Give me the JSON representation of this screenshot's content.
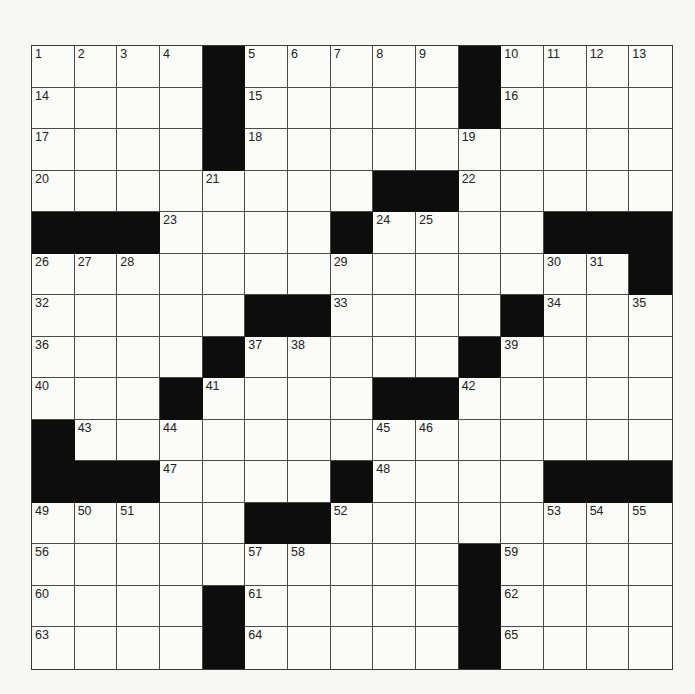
{
  "puzzle": {
    "rows": 15,
    "cols": 15,
    "colors": {
      "black_square": "#0d0d0d",
      "white_square": "#fbfbf9",
      "grid_line": "#4a4a4a",
      "number_text": "#222222"
    },
    "black_squares": [
      [
        0,
        4
      ],
      [
        0,
        10
      ],
      [
        1,
        4
      ],
      [
        1,
        10
      ],
      [
        2,
        4
      ],
      [
        3,
        8
      ],
      [
        3,
        9
      ],
      [
        4,
        0
      ],
      [
        4,
        1
      ],
      [
        4,
        2
      ],
      [
        4,
        7
      ],
      [
        4,
        12
      ],
      [
        4,
        13
      ],
      [
        4,
        14
      ],
      [
        5,
        14
      ],
      [
        6,
        5
      ],
      [
        6,
        6
      ],
      [
        6,
        11
      ],
      [
        7,
        4
      ],
      [
        7,
        10
      ],
      [
        8,
        3
      ],
      [
        8,
        8
      ],
      [
        8,
        9
      ],
      [
        9,
        0
      ],
      [
        10,
        0
      ],
      [
        10,
        1
      ],
      [
        10,
        2
      ],
      [
        10,
        7
      ],
      [
        10,
        12
      ],
      [
        10,
        13
      ],
      [
        10,
        14
      ],
      [
        11,
        5
      ],
      [
        11,
        6
      ],
      [
        12,
        10
      ],
      [
        13,
        4
      ],
      [
        13,
        10
      ],
      [
        14,
        4
      ],
      [
        14,
        10
      ]
    ],
    "numbered_cells": [
      {
        "r": 0,
        "c": 0,
        "n": "1"
      },
      {
        "r": 0,
        "c": 1,
        "n": "2"
      },
      {
        "r": 0,
        "c": 2,
        "n": "3"
      },
      {
        "r": 0,
        "c": 3,
        "n": "4"
      },
      {
        "r": 0,
        "c": 5,
        "n": "5"
      },
      {
        "r": 0,
        "c": 6,
        "n": "6"
      },
      {
        "r": 0,
        "c": 7,
        "n": "7"
      },
      {
        "r": 0,
        "c": 8,
        "n": "8"
      },
      {
        "r": 0,
        "c": 9,
        "n": "9"
      },
      {
        "r": 0,
        "c": 11,
        "n": "10"
      },
      {
        "r": 0,
        "c": 12,
        "n": "11"
      },
      {
        "r": 0,
        "c": 13,
        "n": "12"
      },
      {
        "r": 0,
        "c": 14,
        "n": "13"
      },
      {
        "r": 1,
        "c": 0,
        "n": "14"
      },
      {
        "r": 1,
        "c": 5,
        "n": "15"
      },
      {
        "r": 1,
        "c": 11,
        "n": "16"
      },
      {
        "r": 2,
        "c": 0,
        "n": "17"
      },
      {
        "r": 2,
        "c": 5,
        "n": "18"
      },
      {
        "r": 2,
        "c": 10,
        "n": "19"
      },
      {
        "r": 3,
        "c": 0,
        "n": "20"
      },
      {
        "r": 3,
        "c": 4,
        "n": "21"
      },
      {
        "r": 3,
        "c": 10,
        "n": "22"
      },
      {
        "r": 4,
        "c": 3,
        "n": "23"
      },
      {
        "r": 4,
        "c": 8,
        "n": "24"
      },
      {
        "r": 4,
        "c": 9,
        "n": "25"
      },
      {
        "r": 5,
        "c": 0,
        "n": "26"
      },
      {
        "r": 5,
        "c": 1,
        "n": "27"
      },
      {
        "r": 5,
        "c": 2,
        "n": "28"
      },
      {
        "r": 5,
        "c": 7,
        "n": "29"
      },
      {
        "r": 5,
        "c": 12,
        "n": "30"
      },
      {
        "r": 5,
        "c": 13,
        "n": "31"
      },
      {
        "r": 6,
        "c": 0,
        "n": "32"
      },
      {
        "r": 6,
        "c": 7,
        "n": "33"
      },
      {
        "r": 6,
        "c": 12,
        "n": "34"
      },
      {
        "r": 6,
        "c": 14,
        "n": "35"
      },
      {
        "r": 7,
        "c": 0,
        "n": "36"
      },
      {
        "r": 7,
        "c": 5,
        "n": "37"
      },
      {
        "r": 7,
        "c": 6,
        "n": "38"
      },
      {
        "r": 7,
        "c": 11,
        "n": "39"
      },
      {
        "r": 8,
        "c": 0,
        "n": "40"
      },
      {
        "r": 8,
        "c": 4,
        "n": "41"
      },
      {
        "r": 8,
        "c": 10,
        "n": "42"
      },
      {
        "r": 9,
        "c": 1,
        "n": "43"
      },
      {
        "r": 9,
        "c": 3,
        "n": "44"
      },
      {
        "r": 9,
        "c": 8,
        "n": "45"
      },
      {
        "r": 9,
        "c": 9,
        "n": "46"
      },
      {
        "r": 10,
        "c": 3,
        "n": "47"
      },
      {
        "r": 10,
        "c": 8,
        "n": "48"
      },
      {
        "r": 11,
        "c": 0,
        "n": "49"
      },
      {
        "r": 11,
        "c": 1,
        "n": "50"
      },
      {
        "r": 11,
        "c": 2,
        "n": "51"
      },
      {
        "r": 11,
        "c": 7,
        "n": "52"
      },
      {
        "r": 11,
        "c": 12,
        "n": "53"
      },
      {
        "r": 11,
        "c": 13,
        "n": "54"
      },
      {
        "r": 11,
        "c": 14,
        "n": "55"
      },
      {
        "r": 12,
        "c": 0,
        "n": "56"
      },
      {
        "r": 12,
        "c": 5,
        "n": "57"
      },
      {
        "r": 12,
        "c": 6,
        "n": "58"
      },
      {
        "r": 12,
        "c": 11,
        "n": "59"
      },
      {
        "r": 13,
        "c": 0,
        "n": "60"
      },
      {
        "r": 13,
        "c": 5,
        "n": "61"
      },
      {
        "r": 13,
        "c": 11,
        "n": "62"
      },
      {
        "r": 14,
        "c": 0,
        "n": "63"
      },
      {
        "r": 14,
        "c": 5,
        "n": "64"
      },
      {
        "r": 14,
        "c": 11,
        "n": "65"
      }
    ]
  }
}
